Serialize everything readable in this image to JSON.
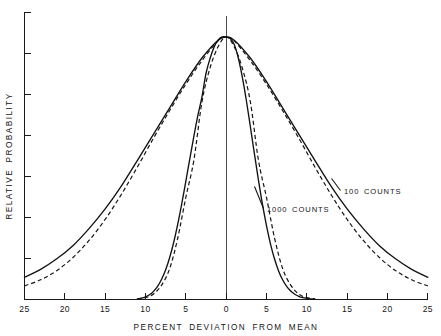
{
  "chart_data": {
    "type": "line",
    "title": "",
    "xlabel": "PERCENT DEVIATION FROM MEAN",
    "ylabel": "RELATIVE PROBABILITY",
    "xlim": [
      -25,
      25
    ],
    "ylim": [
      0,
      1.0
    ],
    "grid": false,
    "legend_position": "inline-annotations",
    "x_ticks": [
      -25,
      -20,
      -15,
      -10,
      -5,
      0,
      5,
      10,
      15,
      20,
      25
    ],
    "x_tick_labels": [
      "25",
      "20",
      "15",
      "10",
      "5",
      "0",
      "5",
      "10",
      "15",
      "20",
      "25"
    ],
    "y_ticks": [
      0,
      0.143,
      0.286,
      0.429,
      0.571,
      0.714,
      0.857,
      1.0
    ],
    "y_tick_labels": [
      "",
      "",
      "",
      "",
      "",
      "",
      "",
      ""
    ],
    "annotations": [
      {
        "text": "1000 COUNTS",
        "x": -1.5,
        "y": 0.235,
        "series": "1000-counts"
      },
      {
        "text": "100 COUNTS",
        "x": 13.0,
        "y": 0.32,
        "series": "100-counts"
      }
    ],
    "series": [
      {
        "name": "1000 COUNTS (Poisson)",
        "style": "solid",
        "sigma_percent": 3.16,
        "x": [
          -11.0,
          -10.5,
          -10.0,
          -9.5,
          -9.0,
          -8.5,
          -8.0,
          -7.5,
          -7.0,
          -6.5,
          -6.0,
          -5.5,
          -5.0,
          -4.5,
          -4.0,
          -3.5,
          -3.0,
          -2.5,
          -2.0,
          -1.5,
          -1.0,
          -0.5,
          0.0,
          0.5,
          1.0,
          1.5,
          2.0,
          2.5,
          3.0,
          3.5,
          4.0,
          4.5,
          5.0,
          5.5,
          6.0,
          6.5,
          7.0,
          7.5,
          8.0,
          8.5,
          9.0,
          9.5,
          10.0,
          10.5,
          11.0
        ],
        "y": [
          0.002,
          0.005,
          0.01,
          0.018,
          0.031,
          0.05,
          0.077,
          0.113,
          0.16,
          0.218,
          0.287,
          0.365,
          0.45,
          0.537,
          0.622,
          0.702,
          0.772,
          0.861,
          0.918,
          0.961,
          0.988,
          1.0,
          1.0,
          0.994,
          0.971,
          0.921,
          0.848,
          0.759,
          0.659,
          0.556,
          0.456,
          0.363,
          0.281,
          0.211,
          0.154,
          0.109,
          0.075,
          0.05,
          0.032,
          0.02,
          0.012,
          0.007,
          0.004,
          0.002,
          0.001
        ]
      },
      {
        "name": "1000 COUNTS (Gaussian)",
        "style": "dashed",
        "sigma_percent": 3.16,
        "x": [
          -11.0,
          -10.0,
          -9.0,
          -8.0,
          -7.0,
          -6.0,
          -5.0,
          -4.0,
          -3.0,
          -2.0,
          -1.0,
          0.0,
          1.0,
          2.0,
          3.0,
          4.0,
          5.0,
          6.0,
          7.0,
          8.0,
          9.0,
          10.0,
          11.0
        ],
        "y": [
          0.003,
          0.007,
          0.021,
          0.055,
          0.118,
          0.234,
          0.389,
          0.531,
          0.753,
          0.882,
          0.963,
          1.0,
          0.963,
          0.882,
          0.753,
          0.531,
          0.389,
          0.234,
          0.118,
          0.055,
          0.021,
          0.007,
          0.003
        ]
      },
      {
        "name": "100 COUNTS (Poisson)",
        "style": "solid",
        "sigma_percent": 10.0,
        "x": [
          -25,
          -23,
          -21,
          -19,
          -17,
          -15,
          -13,
          -11,
          -9,
          -7,
          -5,
          -3,
          -1,
          0,
          1,
          3,
          5,
          7,
          9,
          11,
          13,
          15,
          17,
          19,
          21,
          23,
          25
        ],
        "y": [
          0.085,
          0.115,
          0.155,
          0.205,
          0.27,
          0.345,
          0.432,
          0.53,
          0.63,
          0.73,
          0.83,
          0.92,
          0.988,
          1.0,
          0.988,
          0.92,
          0.83,
          0.73,
          0.63,
          0.53,
          0.432,
          0.345,
          0.27,
          0.205,
          0.155,
          0.115,
          0.085
        ]
      },
      {
        "name": "100 COUNTS (Gaussian)",
        "style": "dashed",
        "sigma_percent": 10.0,
        "x": [
          -25,
          -23,
          -21,
          -19,
          -17,
          -15,
          -13,
          -11,
          -9,
          -7,
          -5,
          -3,
          -1,
          0,
          1,
          3,
          5,
          7,
          9,
          11,
          13,
          15,
          17,
          19,
          21,
          23,
          25
        ],
        "y": [
          0.052,
          0.075,
          0.11,
          0.16,
          0.225,
          0.305,
          0.4,
          0.505,
          0.615,
          0.72,
          0.82,
          0.91,
          0.985,
          1.0,
          0.985,
          0.91,
          0.82,
          0.72,
          0.615,
          0.505,
          0.4,
          0.305,
          0.225,
          0.16,
          0.11,
          0.075,
          0.052
        ]
      }
    ]
  },
  "axes": {
    "x_title": "PERCENT DEVIATION FROM MEAN",
    "y_title": "RELATIVE PROBABILITY",
    "x_tick_labels": [
      "25",
      "20",
      "15",
      "10",
      "5",
      "0",
      "5",
      "10",
      "15",
      "20",
      "25"
    ]
  },
  "labels": {
    "thousand_counts": "1000 COUNTS",
    "hundred_counts": "100 COUNTS"
  },
  "colors": {
    "ink": "#121212",
    "axis": "#1a1a1a",
    "background": "#ffffff"
  }
}
